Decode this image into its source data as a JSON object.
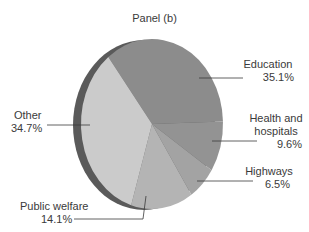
{
  "chart_data": {
    "type": "pie",
    "title": "Panel (b)",
    "style": "3d-tilted",
    "categories": [
      "Education",
      "Health and hospitals",
      "Highways",
      "Public welfare",
      "Other"
    ],
    "values": [
      35.1,
      9.6,
      6.5,
      14.1,
      34.7
    ],
    "unit": "%",
    "labels": [
      {
        "name": "Education",
        "value": "35.1%"
      },
      {
        "name": "Health and hospitals",
        "name_line1": "Health and",
        "name_line2": "hospitals",
        "value": "9.6%"
      },
      {
        "name": "Highways",
        "value": "6.5%"
      },
      {
        "name": "Public welfare",
        "value": "14.1%"
      },
      {
        "name": "Other",
        "value": "34.7%"
      }
    ],
    "colors": [
      "#8c8c8c",
      "#939393",
      "#a3a3a3",
      "#b4b4b4",
      "#cbcbcb"
    ],
    "rim_color": "#5a5a5a",
    "legend": "none (leader-line labels)"
  }
}
